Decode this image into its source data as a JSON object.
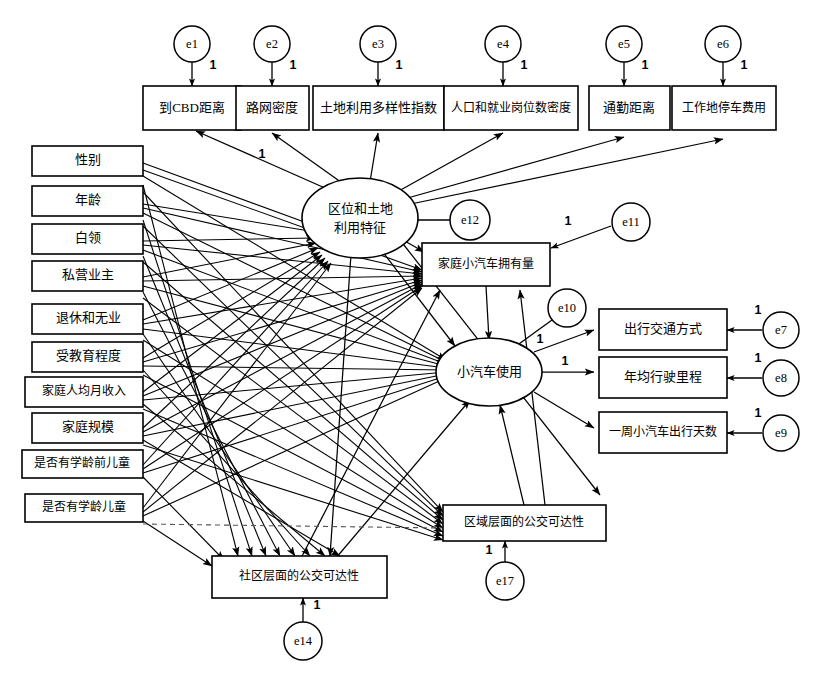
{
  "diagram": {
    "type": "structural-equation-model",
    "background_color": "#ffffff",
    "line_color": "#000000",
    "fixed_loading_label": "1"
  },
  "indicators_top": [
    {
      "id": "y1",
      "label": "到CBD距离",
      "error": "e1",
      "error_label": "1"
    },
    {
      "id": "y2",
      "label": "路网密度",
      "error": "e2",
      "error_label": "1"
    },
    {
      "id": "y3",
      "label": "土地利用多样性指数",
      "error": "e3",
      "error_label": "1"
    },
    {
      "id": "y4",
      "label": "人口和就业岗位数密度",
      "error": "e4",
      "error_label": "1"
    },
    {
      "id": "y5",
      "label": "通勤距离",
      "error": "e5",
      "error_label": "1"
    },
    {
      "id": "y6",
      "label": "工作地停车费用",
      "error": "e6",
      "error_label": "1"
    }
  ],
  "exogenous_left": [
    {
      "id": "x1",
      "label": "性别"
    },
    {
      "id": "x2",
      "label": "年龄"
    },
    {
      "id": "x3",
      "label": "白领"
    },
    {
      "id": "x4",
      "label": "私营业主"
    },
    {
      "id": "x5",
      "label": "退休和无业"
    },
    {
      "id": "x6",
      "label": "受教育程度"
    },
    {
      "id": "x7",
      "label": "家庭人均月收入"
    },
    {
      "id": "x8",
      "label": "家庭规模"
    },
    {
      "id": "x9",
      "label": "是否有学龄前儿童"
    },
    {
      "id": "x10",
      "label": "是否有学龄儿童"
    }
  ],
  "latents": [
    {
      "id": "L1",
      "label_line1": "区位和土地",
      "label_line2": "利用特征",
      "error": "e12"
    },
    {
      "id": "L2",
      "label_line1": "小汽车使用",
      "label_line2": "",
      "error": "e10",
      "error_label": "1"
    }
  ],
  "endogenous": [
    {
      "id": "M1",
      "label": "家庭小汽车拥有量",
      "error": "e11",
      "error_label": "1"
    },
    {
      "id": "M2",
      "label": "社区层面的公交可达性",
      "error": "e14",
      "error_label": "1"
    },
    {
      "id": "M3",
      "label": "区域层面的公交可达性",
      "error": "e17",
      "error_label": "1"
    }
  ],
  "indicators_right": [
    {
      "id": "y7",
      "label": "出行交通方式",
      "error": "e7",
      "error_label": "1"
    },
    {
      "id": "y8",
      "label": "年均行驶里程",
      "error": "e8",
      "error_label": "1"
    },
    {
      "id": "y9",
      "label": "一周小汽车出行天数",
      "error": "e9",
      "error_label": "1"
    }
  ],
  "free_labels": [
    {
      "id": "fix_L1_y2",
      "text": "1"
    },
    {
      "id": "fix_L2_y8",
      "text": "1"
    }
  ]
}
